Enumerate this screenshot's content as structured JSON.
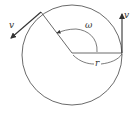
{
  "diagram": {
    "type": "circular-motion",
    "labels": {
      "velocity_left": "v",
      "velocity_right": "v",
      "angular_velocity": "ω",
      "radius": "r"
    },
    "colors": {
      "stroke": "#333333",
      "background": "#ffffff"
    }
  }
}
